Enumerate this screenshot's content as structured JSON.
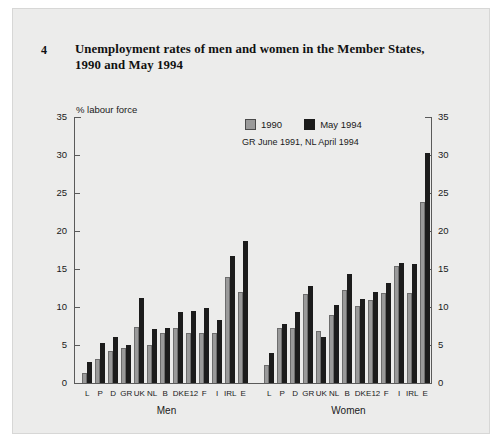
{
  "figure": {
    "number": "4",
    "title": "Unemployment rates of men and women in the Member States, 1990 and May 1994",
    "axis_unit": "% labour force",
    "note": "GR June 1991, NL April 1994"
  },
  "legend": {
    "items": [
      {
        "label": "1990",
        "color": "#9a9a9a"
      },
      {
        "label": "May 1994",
        "color": "#1c1c1c"
      }
    ]
  },
  "groups": [
    {
      "label": "Men"
    },
    {
      "label": "Women"
    }
  ],
  "chart_data": {
    "type": "bar",
    "title": "Unemployment rates of men and women in the Member States, 1990 and May 1994",
    "subtitle": "GR June 1991, NL April 1994",
    "xlabel": "",
    "ylabel": "% labour force",
    "ylim": [
      0,
      35
    ],
    "yticks": [
      0,
      5,
      10,
      15,
      20,
      25,
      30,
      35
    ],
    "grid": false,
    "legend_position": "top-center",
    "panels": [
      {
        "name": "Men",
        "categories": [
          "L",
          "P",
          "D",
          "GR",
          "UK",
          "NL",
          "B",
          "DK",
          "E12",
          "F",
          "I",
          "IRL",
          "E"
        ],
        "series": [
          {
            "name": "1990",
            "color": "#9a9a9a",
            "values": [
              1.3,
              3.1,
              4.2,
              4.6,
              7.4,
              5.0,
              6.6,
              7.2,
              6.6,
              6.6,
              6.6,
              14.0,
              12.0
            ]
          },
          {
            "name": "May 1994",
            "color": "#1c1c1c",
            "values": [
              2.8,
              5.2,
              6.0,
              5.0,
              11.2,
              7.1,
              7.3,
              9.4,
              9.5,
              9.9,
              8.3,
              16.7,
              18.7
            ]
          }
        ]
      },
      {
        "name": "Women",
        "categories": [
          "L",
          "P",
          "D",
          "GR",
          "UK",
          "NL",
          "B",
          "DK",
          "E12",
          "F",
          "I",
          "IRL",
          "E"
        ],
        "series": [
          {
            "name": "1990",
            "color": "#9a9a9a",
            "values": [
              2.4,
              7.3,
              7.2,
              11.7,
              6.8,
              9.0,
              12.2,
              10.1,
              10.9,
              11.9,
              15.4,
              11.8,
              23.8
            ]
          },
          {
            "name": "May 1994",
            "color": "#1c1c1c",
            "values": [
              4.0,
              7.7,
              9.3,
              12.7,
              6.1,
              10.2,
              14.4,
              11.1,
              12.0,
              13.2,
              15.8,
              15.6,
              30.2
            ]
          }
        ]
      }
    ]
  },
  "y_axis_labels": [
    "35",
    "30",
    "25",
    "20",
    "15",
    "10",
    "5",
    "0"
  ]
}
